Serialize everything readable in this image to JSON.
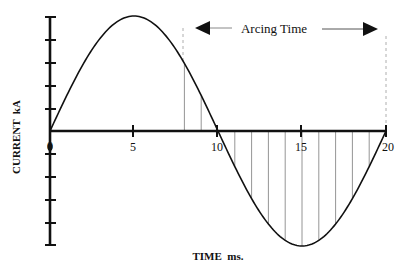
{
  "chart_data": {
    "type": "line",
    "title": "",
    "xlabel": "TIME  ms.",
    "ylabel": "CURRENT  kA",
    "x_ticks": [
      0,
      5,
      10,
      15,
      20
    ],
    "x_tick_labels": [
      "0",
      "5",
      "10",
      "15",
      "20"
    ],
    "xlim": [
      0,
      20
    ],
    "y_ticks_count_above": 5,
    "y_ticks_count_below": 5,
    "y_tick_labels": [],
    "grid": false,
    "series": [
      {
        "name": "AC current (sine wave)",
        "function": "sin(2*pi*t/20)",
        "period_ms": 20,
        "x": [
          0,
          1,
          2,
          3,
          4,
          5,
          6,
          7,
          8,
          9,
          10,
          11,
          12,
          13,
          14,
          15,
          16,
          17,
          18,
          19,
          20
        ],
        "values": [
          0,
          0.309,
          0.588,
          0.809,
          0.951,
          1.0,
          0.951,
          0.809,
          0.588,
          0.309,
          0,
          -0.309,
          -0.588,
          -0.809,
          -0.951,
          -1.0,
          -0.951,
          -0.809,
          -0.588,
          -0.309,
          0
        ]
      }
    ],
    "hatched_region": {
      "x_start_ms": 8,
      "x_end_ms": 20,
      "hatch_spacing_ms": 1,
      "style": "vertical lines between curve and axis"
    },
    "annotations": [
      {
        "text": "Arcing Time",
        "type": "double-headed arrow",
        "x_start_ms": 8,
        "x_end_ms": 20,
        "boundary_lines": "dashed vertical"
      }
    ]
  },
  "labels": {
    "arcing_time": "Arcing Time",
    "x_axis": "TIME  ms.",
    "y_axis": "CURRENT  kA",
    "x_tick_0": "0",
    "x_tick_5": "5",
    "x_tick_10": "10",
    "x_tick_15": "15",
    "x_tick_20": "20"
  },
  "colors": {
    "ink": "#111111",
    "hatch": "#777777",
    "background": "#ffffff"
  }
}
